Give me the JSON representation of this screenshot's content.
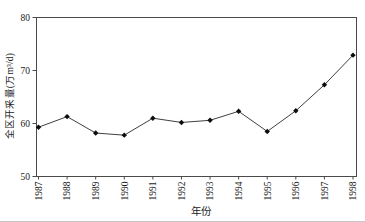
{
  "chart_data": {
    "type": "line",
    "title": "",
    "xlabel": "年份",
    "ylabel": "全区开采量(万m³/d)",
    "categories": [
      "1987",
      "1988",
      "1989",
      "1990",
      "1991",
      "1992",
      "1993",
      "1994",
      "1995",
      "1996",
      "1997",
      "1998"
    ],
    "series": [
      {
        "name": "全区开采量",
        "values": [
          59.3,
          61.3,
          58.2,
          57.8,
          61.0,
          60.2,
          60.6,
          62.3,
          58.5,
          62.4,
          67.3,
          72.9
        ]
      }
    ],
    "ylim": [
      50,
      80
    ],
    "yticks": [
      50,
      60,
      70,
      80
    ],
    "grid": false,
    "legend": "none",
    "marker": "diamond",
    "colors": {
      "line": "#404040",
      "marker": "#0d0d0d",
      "axis": "#4a4a4a",
      "text": "#1a1a1a"
    }
  }
}
